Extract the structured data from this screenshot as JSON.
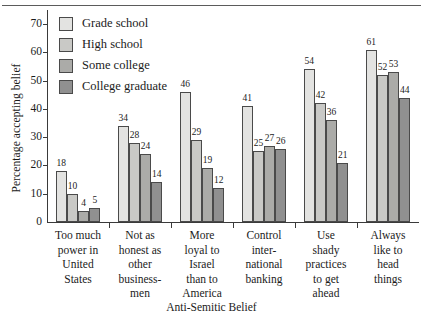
{
  "chart_data": {
    "type": "bar",
    "title": "",
    "xlabel": "Anti-Semitic Belief",
    "ylabel": "Percentage accepting belief",
    "ylim": [
      0,
      75
    ],
    "yticks": [
      0,
      10,
      20,
      30,
      40,
      50,
      60,
      70
    ],
    "ytick_labels": [
      "0",
      "10",
      "20",
      "30",
      "40",
      "50",
      "60",
      "70"
    ],
    "grid": false,
    "legend_position": "upper-left-inside",
    "categories": [
      "Too much power in United States",
      "Not as honest as other businessmen",
      "More loyal to Israel than to America",
      "Control international banking",
      "Use shady practices to get ahead",
      "Always like to head things"
    ],
    "category_lines": [
      [
        "Too much",
        "power in",
        "United",
        "States"
      ],
      [
        "Not as",
        "honest as",
        "other",
        "business-",
        "men"
      ],
      [
        "More",
        "loyal to",
        "Israel",
        "than to",
        "America"
      ],
      [
        "Control",
        "inter-",
        "national",
        "banking"
      ],
      [
        "Use",
        "shady",
        "practices",
        "to get",
        "ahead"
      ],
      [
        "Always",
        "like to",
        "head",
        "things"
      ]
    ],
    "series": [
      {
        "name": "Grade school",
        "color": "#e3e3e1",
        "values": [
          18,
          34,
          46,
          41,
          54,
          61
        ]
      },
      {
        "name": "High school",
        "color": "#c9c9c6",
        "values": [
          10,
          28,
          29,
          25,
          42,
          52
        ]
      },
      {
        "name": "Some college",
        "color": "#ababa8",
        "values": [
          4,
          24,
          19,
          27,
          36,
          53
        ]
      },
      {
        "name": "College graduate",
        "color": "#909090",
        "values": [
          5,
          14,
          12,
          26,
          21,
          44
        ]
      }
    ]
  },
  "colors": {
    "axis": "#3a3a3a",
    "bar_outline": "#4a4a4a",
    "text": "#1b1b1b",
    "rule": "#5b5b5b"
  }
}
